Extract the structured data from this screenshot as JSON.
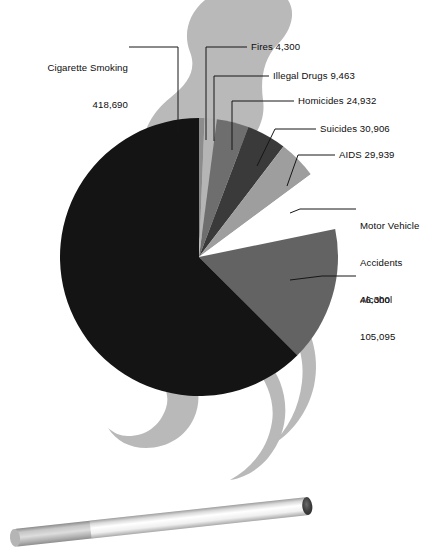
{
  "chart_data": {
    "type": "pie",
    "title": "",
    "subtitle": "",
    "xlabel": "",
    "ylabel": "",
    "legend_position": "callout-labels",
    "grid": false,
    "total": 669625,
    "units": "deaths per year",
    "categories": [
      "Cigarette Smoking",
      "Fires",
      "Illegal Drugs",
      "Homicides",
      "Suicides",
      "AIDS",
      "Motor Vehicle Accidents",
      "Alcohol"
    ],
    "values": [
      418690,
      4300,
      9463,
      24932,
      30906,
      29939,
      46300,
      105095
    ],
    "value_labels": [
      "418,690",
      "4,300",
      "9,463",
      "24,932",
      "30,906",
      "29,939",
      "46,300",
      "105,095"
    ],
    "colors": [
      "#141414",
      "#8c8c8c",
      "#b5b5b5",
      "#6e6e6e",
      "#3a3a3a",
      "#9e9e9e",
      "#ffffff",
      "#636363"
    ],
    "slices": [
      {
        "name": "Cigarette Smoking",
        "value": 418690,
        "value_label": "418,690",
        "color": "#141414",
        "percent": 62.5
      },
      {
        "name": "Fires",
        "value": 4300,
        "value_label": "4,300",
        "color": "#8c8c8c",
        "percent": 0.6
      },
      {
        "name": "Illegal Drugs",
        "value": 9463,
        "value_label": "9,463",
        "color": "#b5b5b5",
        "percent": 1.4
      },
      {
        "name": "Homicides",
        "value": 24932,
        "value_label": "24,932",
        "color": "#6e6e6e",
        "percent": 3.7
      },
      {
        "name": "Suicides",
        "value": 30906,
        "value_label": "30,906",
        "color": "#3a3a3a",
        "percent": 4.6
      },
      {
        "name": "AIDS",
        "value": 29939,
        "value_label": "29,939",
        "color": "#9e9e9e",
        "percent": 4.5
      },
      {
        "name": "Motor Vehicle Accidents",
        "value": 46300,
        "value_label": "46,300",
        "color": "#ffffff",
        "percent": 6.9
      },
      {
        "name": "Alcohol",
        "value": 105095,
        "value_label": "105,095",
        "color": "#636363",
        "percent": 15.7
      }
    ]
  },
  "labels": {
    "cigarette_smoking_name": "Cigarette Smoking",
    "cigarette_smoking_value": "418,690",
    "fires": "Fires 4,300",
    "illegal_drugs": "Illegal Drugs 9,463",
    "homicides": "Homicides 24,932",
    "suicides": "Suicides 30,906",
    "aids": "AIDS 29,939",
    "motor_vehicle_name": "Motor Vehicle",
    "motor_vehicle_name2": "Accidents",
    "motor_vehicle_value": "46,300",
    "alcohol_name": "Alcohol",
    "alcohol_value": "105,095"
  },
  "graphics": {
    "smoke_plume_color": "#b9b9b9",
    "cigarette_filter_color": "#9a9a9a",
    "cigarette_paper_color": "#f2f2f2",
    "cigarette_ember_color": "#4a4a4a",
    "background_color": "#ffffff",
    "leader_line_color": "#161616"
  }
}
